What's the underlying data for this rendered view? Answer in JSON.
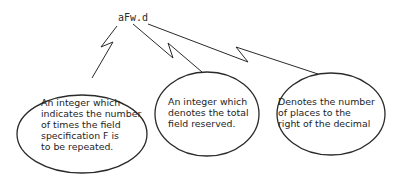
{
  "diagram": {
    "format_spec": "aFw.d",
    "callouts": [
      {
        "id": "count",
        "points_to": "a",
        "lines": [
          "An integer which",
          "indicates the number",
          "of times the field",
          "specification F is",
          "to be repeated."
        ]
      },
      {
        "id": "width",
        "points_to": "w",
        "lines": [
          "An integer which",
          "denotes the total",
          "field reserved."
        ]
      },
      {
        "id": "decimal",
        "points_to": "d",
        "lines": [
          "Denotes the number",
          "of places to the",
          "right of the decimal"
        ]
      }
    ],
    "colors": {
      "stroke": "#2a2a2a",
      "text": "#1e1e1e",
      "background": "#ffffff"
    }
  }
}
